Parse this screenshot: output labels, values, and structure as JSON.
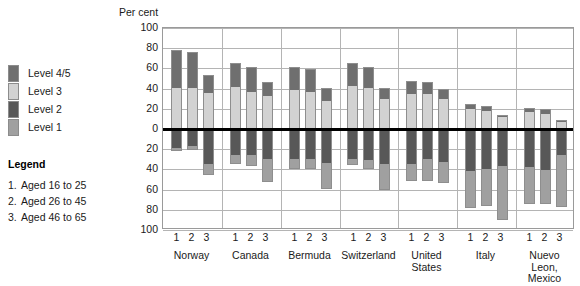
{
  "legend": {
    "levels": [
      {
        "label": "Level 4/5",
        "color": "#6f6f6f",
        "swatch": "level-45-swatch"
      },
      {
        "label": "Level 3",
        "color": "#d2d2d2",
        "swatch": "level-3-swatch"
      },
      {
        "label": "Level 2",
        "color": "#585858",
        "swatch": "level-2-swatch"
      },
      {
        "label": "Level 1",
        "color": "#a0a0a0",
        "swatch": "level-1-swatch"
      }
    ],
    "title": "Legend",
    "ages": [
      {
        "num": "1.",
        "text": "Aged 16 to 25"
      },
      {
        "num": "2.",
        "text": "Aged 26 to 45"
      },
      {
        "num": "3.",
        "text": "Aged 46 to 65"
      }
    ]
  },
  "chart_data": {
    "type": "bar",
    "title": "",
    "ylabel": "Per cent",
    "xlabel": "",
    "stacked": true,
    "diverging": true,
    "grid": true,
    "legend_position": "left",
    "ylim": [
      -100,
      100
    ],
    "yticks": [
      100,
      80,
      60,
      40,
      20,
      0,
      20,
      40,
      60,
      80,
      100
    ],
    "ytick_values": [
      100,
      80,
      60,
      40,
      20,
      0,
      -20,
      -40,
      -60,
      -80,
      -100
    ],
    "series": [
      {
        "name": "Level 4/5",
        "color": "#6f6f6f",
        "direction": "up"
      },
      {
        "name": "Level 3",
        "color": "#d2d2d2",
        "direction": "up"
      },
      {
        "name": "Level 2",
        "color": "#585858",
        "direction": "down"
      },
      {
        "name": "Level 1",
        "color": "#a0a0a0",
        "direction": "down"
      }
    ],
    "categories": [
      "Norway",
      "Canada",
      "Bermuda",
      "Switzerland",
      "United States",
      "Italy",
      "Nuevo Leon, Mexico"
    ],
    "subgroups": [
      "1",
      "2",
      "3"
    ],
    "data": [
      {
        "country": "Norway",
        "bars": [
          {
            "group": "1",
            "level45": 37,
            "level3": 41,
            "level2": 19,
            "level1": 3
          },
          {
            "group": "2",
            "level45": 35,
            "level3": 41,
            "level2": 17,
            "level1": 4
          },
          {
            "group": "3",
            "level45": 17,
            "level3": 36,
            "level2": 35,
            "level1": 11
          }
        ]
      },
      {
        "country": "Canada",
        "bars": [
          {
            "group": "1",
            "level45": 23,
            "level3": 42,
            "level2": 26,
            "level1": 9
          },
          {
            "group": "2",
            "level45": 24,
            "level3": 37,
            "level2": 26,
            "level1": 11
          },
          {
            "group": "3",
            "level45": 14,
            "level3": 33,
            "level2": 30,
            "level1": 22
          }
        ]
      },
      {
        "country": "Bermuda",
        "bars": [
          {
            "group": "1",
            "level45": 22,
            "level3": 39,
            "level2": 30,
            "level1": 10
          },
          {
            "group": "2",
            "level45": 22,
            "level3": 37,
            "level2": 30,
            "level1": 10
          },
          {
            "group": "3",
            "level45": 13,
            "level3": 28,
            "level2": 34,
            "level1": 25
          }
        ]
      },
      {
        "country": "Switzerland",
        "bars": [
          {
            "group": "1",
            "level45": 22,
            "level3": 43,
            "level2": 30,
            "level1": 6
          },
          {
            "group": "2",
            "level45": 20,
            "level3": 41,
            "level2": 31,
            "level1": 9
          },
          {
            "group": "3",
            "level45": 11,
            "level3": 30,
            "level2": 35,
            "level1": 25
          }
        ]
      },
      {
        "country": "United States",
        "bars": [
          {
            "group": "1",
            "level45": 13,
            "level3": 35,
            "level2": 35,
            "level1": 16
          },
          {
            "group": "2",
            "level45": 12,
            "level3": 35,
            "level2": 30,
            "level1": 21
          },
          {
            "group": "3",
            "level45": 10,
            "level3": 30,
            "level2": 33,
            "level1": 20
          }
        ]
      },
      {
        "country": "Italy",
        "bars": [
          {
            "group": "1",
            "level45": 5,
            "level3": 20,
            "level2": 42,
            "level1": 36
          },
          {
            "group": "2",
            "level45": 5,
            "level3": 18,
            "level2": 40,
            "level1": 36
          },
          {
            "group": "3",
            "level45": 2,
            "level3": 12,
            "level2": 37,
            "level1": 53
          }
        ]
      },
      {
        "country": "Nuevo Leon, Mexico",
        "bars": [
          {
            "group": "1",
            "level45": 4,
            "level3": 17,
            "level2": 38,
            "level1": 36
          },
          {
            "group": "2",
            "level45": 5,
            "level3": 15,
            "level2": 41,
            "level1": 33
          },
          {
            "group": "3",
            "level45": 2,
            "level3": 7,
            "level2": 26,
            "level1": 51
          }
        ]
      }
    ]
  }
}
